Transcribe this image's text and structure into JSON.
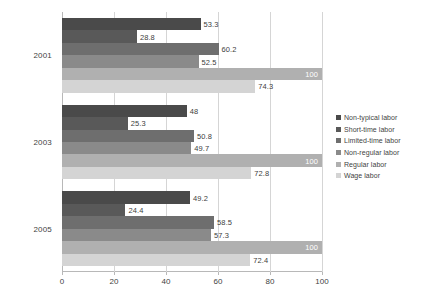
{
  "chart_data": {
    "type": "bar",
    "orientation": "horizontal",
    "title": "",
    "xlabel": "",
    "ylabel": "",
    "xlim": [
      0,
      100
    ],
    "xticks": [
      0,
      20,
      40,
      60,
      80,
      100
    ],
    "grid": true,
    "legend_position": "right",
    "categories": [
      "2001",
      "2003",
      "2005"
    ],
    "series": [
      {
        "name": "Non-typical labor",
        "color": "#4a4a4a",
        "values": [
          53.3,
          48,
          49.2
        ],
        "labels": [
          "53.3",
          "48",
          "49.2"
        ]
      },
      {
        "name": "Short-time labor",
        "color": "#595959",
        "values": [
          28.8,
          25.3,
          24.4
        ],
        "labels": [
          "28.8",
          "25.3",
          "24.4"
        ]
      },
      {
        "name": "Limited-time labor",
        "color": "#6e6e6e",
        "values": [
          60.2,
          50.8,
          58.5
        ],
        "labels": [
          "60.2",
          "50.8",
          "58.5"
        ]
      },
      {
        "name": "Non-regular labor",
        "color": "#8a8a8a",
        "values": [
          52.5,
          49.7,
          57.3
        ],
        "labels": [
          "52.5",
          "49.7",
          "57.3"
        ]
      },
      {
        "name": "Regular labor",
        "color": "#b0b0b0",
        "values": [
          100,
          100,
          100
        ],
        "labels": [
          "100",
          "100",
          "100"
        ]
      },
      {
        "name": "Wage labor",
        "color": "#d4d4d4",
        "values": [
          74.3,
          72.8,
          72.4
        ],
        "labels": [
          "74.3",
          "72.8",
          "72.4"
        ]
      }
    ]
  },
  "legend": {
    "items": [
      {
        "label": "Non-typical labor"
      },
      {
        "label": "Short-time labor"
      },
      {
        "label": "Limited-time labor"
      },
      {
        "label": "Non-regular labor"
      },
      {
        "label": "Regular labor"
      },
      {
        "label": "Wage labor"
      }
    ]
  },
  "axis": {
    "x_tick_labels": [
      "0",
      "20",
      "40",
      "60",
      "80",
      "100"
    ],
    "y_tick_labels": [
      "2001",
      "2003",
      "2005"
    ]
  }
}
